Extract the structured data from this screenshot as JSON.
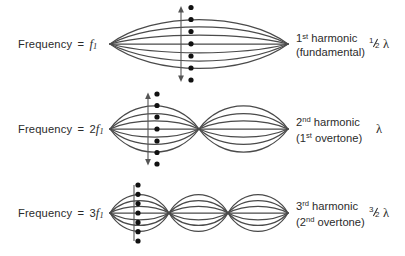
{
  "diagram": {
    "background_color": "#ffffff",
    "curve_color": "#4a4a4a",
    "text_color": "#2b2b2b",
    "node_dot_color": "#111111"
  },
  "rows": [
    {
      "frequency_prefix": "Frequency",
      "equals": "=",
      "multiplier": "",
      "f_symbol": "f",
      "f_subscript": "1",
      "harmonic_number": "1",
      "harmonic_ordinal": "st",
      "harmonic_word": "harmonic",
      "overtone_line": "(fundamental)",
      "wavelength_numerator": "1",
      "wavelength_denominator": "2",
      "wavelength_symbol": "λ",
      "loops": 1,
      "curve_count": 7,
      "dot_count": 7,
      "arrow": "double-headed-vertical"
    },
    {
      "frequency_prefix": "Frequency",
      "equals": "=",
      "multiplier": "2",
      "f_symbol": "f",
      "f_subscript": "1",
      "harmonic_number": "2",
      "harmonic_ordinal": "nd",
      "harmonic_word": "harmonic",
      "overtone_line": "(1st overtone)",
      "overtone_number": "1",
      "overtone_ordinal": "st",
      "overtone_word": "overtone",
      "wavelength_numerator": "",
      "wavelength_denominator": "",
      "wavelength_symbol": "λ",
      "loops": 2,
      "curve_count": 7,
      "dot_count": 7,
      "arrow": "double-headed-vertical"
    },
    {
      "frequency_prefix": "Frequency",
      "equals": "=",
      "multiplier": "3",
      "f_symbol": "f",
      "f_subscript": "1",
      "harmonic_number": "3",
      "harmonic_ordinal": "rd",
      "harmonic_word": "harmonic",
      "overtone_line": "(2nd overtone)",
      "overtone_number": "2",
      "overtone_ordinal": "nd",
      "overtone_word": "overtone",
      "wavelength_numerator": "3",
      "wavelength_denominator": "2",
      "wavelength_symbol": "λ",
      "loops": 3,
      "curve_count": 7,
      "dot_count": 7,
      "arrow": "double-headed-vertical"
    }
  ],
  "geometry": {
    "string_left_x": 10,
    "string_right_x": 188,
    "row1_amplitude": 38,
    "row2_amplitude": 36,
    "row3_amplitude": 30
  }
}
